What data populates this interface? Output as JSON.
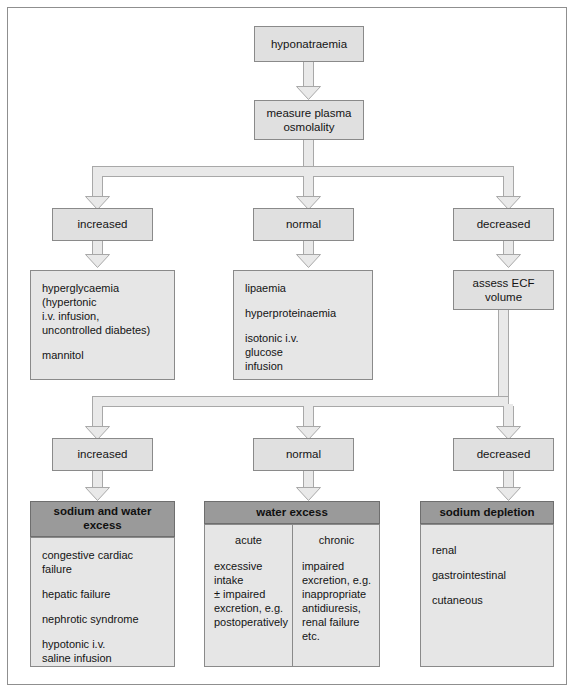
{
  "diagram": {
    "colors": {
      "box_fill": "#e0e0e0",
      "panel_fill": "#e6e6e6",
      "header_fill": "#9a9a9a",
      "connector_fill": "#e9e9e9",
      "border": "#8a8a8a",
      "frame_border": "#8f8f8f",
      "text": "#141414"
    },
    "nodes": {
      "start": "hyponatraemia",
      "measure": "measure plasma\nosmolality",
      "osmolality_branches": {
        "increased": "increased",
        "normal": "normal",
        "decreased": "decreased"
      },
      "increased_causes": [
        "hyperglycaemia\n  (hypertonic\n  i.v. infusion,\n  uncontrolled diabetes)",
        "mannitol"
      ],
      "normal_causes": [
        "lipaemia",
        "hyperproteinaemia",
        "isotonic i.v.\n  glucose\n  infusion"
      ],
      "assess": "assess ECF\nvolume",
      "ecf_branches": {
        "increased": "increased",
        "normal": "normal",
        "decreased": "decreased"
      },
      "outcomes": [
        {
          "header": "sodium and water\nexcess",
          "items": [
            "congestive cardiac\n  failure",
            "hepatic failure",
            "nephrotic syndrome",
            "hypotonic i.v.\n  saline infusion"
          ]
        },
        {
          "header": "water excess",
          "columns": [
            {
              "head": "acute",
              "text": "excessive intake\n  ± impaired\n  excretion, e.g.\n  postoperatively"
            },
            {
              "head": "chronic",
              "text": "impaired\n  excretion, e.g.\n  inappropriate\n  antidiuresis,\n  renal failure etc."
            }
          ]
        },
        {
          "header": "sodium depletion",
          "items": [
            "renal",
            "gastrointestinal",
            "cutaneous"
          ]
        }
      ]
    }
  }
}
